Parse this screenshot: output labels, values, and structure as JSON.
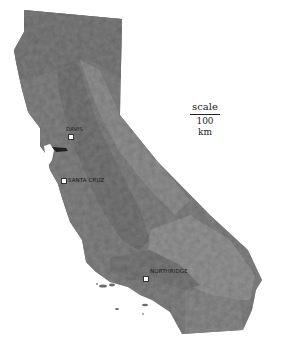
{
  "map": {
    "region": "California",
    "style": "grayscale shaded relief",
    "colors": {
      "background": "#ffffff",
      "land": "#7a7a7a",
      "valley": "#6e6e6e",
      "desert": "#9a9a9a",
      "marker": "#ffffff",
      "label": "#1a1a1a"
    }
  },
  "scale": {
    "label": "scale",
    "distance": "100 km"
  },
  "cities": [
    {
      "name": "DAVIS",
      "x": 70,
      "y": 136
    },
    {
      "name": "SANTA CRUZ",
      "x": 63,
      "y": 180
    },
    {
      "name": "NORTHRIDGE",
      "x": 145,
      "y": 278
    }
  ]
}
